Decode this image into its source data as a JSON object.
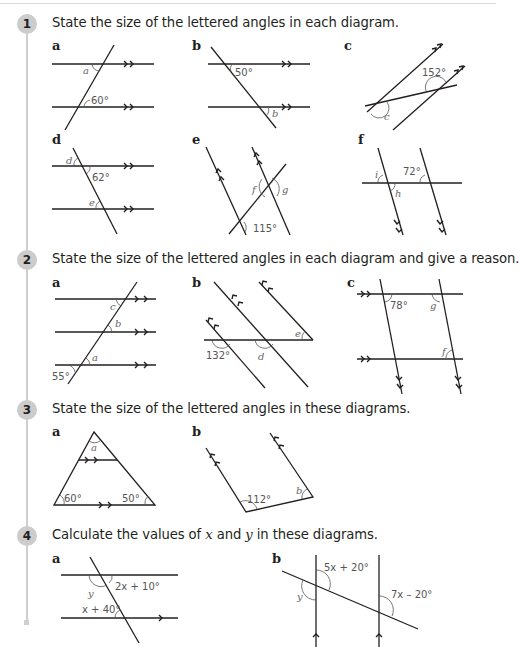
{
  "questions": [
    {
      "number": "1",
      "text": "State the size of the lettered angles in each diagram.",
      "parts": [
        {
          "label": "a",
          "given": [
            "60°"
          ],
          "unknowns": [
            "a"
          ]
        },
        {
          "label": "b",
          "given": [
            "50°"
          ],
          "unknowns": [
            "b"
          ]
        },
        {
          "label": "c",
          "given": [
            "152°"
          ],
          "unknowns": [
            "c"
          ]
        },
        {
          "label": "d",
          "given": [
            "62°"
          ],
          "unknowns": [
            "d",
            "e"
          ]
        },
        {
          "label": "e",
          "given": [
            "115°"
          ],
          "unknowns": [
            "f",
            "g"
          ]
        },
        {
          "label": "f",
          "given": [
            "72°"
          ],
          "unknowns": [
            "i",
            "h"
          ]
        }
      ]
    },
    {
      "number": "2",
      "text": "State the size of the lettered angles in each diagram and give a reason.",
      "parts": [
        {
          "label": "a",
          "given": [
            "55°"
          ],
          "unknowns": [
            "a",
            "b",
            "c"
          ]
        },
        {
          "label": "b",
          "given": [
            "132°"
          ],
          "unknowns": [
            "d",
            "e"
          ]
        },
        {
          "label": "c",
          "given": [
            "78°"
          ],
          "unknowns": [
            "g",
            "f"
          ]
        }
      ]
    },
    {
      "number": "3",
      "text": "State the size of the lettered angles in these diagrams.",
      "parts": [
        {
          "label": "a",
          "given": [
            "60°",
            "50°"
          ],
          "unknowns": [
            "a"
          ]
        },
        {
          "label": "b",
          "given": [
            "112°"
          ],
          "unknowns": [
            "b"
          ]
        }
      ]
    },
    {
      "number": "4",
      "text_pre": "Calculate the values of ",
      "var_x": "x",
      "text_mid": " and ",
      "var_y": "y",
      "text_post": " in these diagrams.",
      "parts": [
        {
          "label": "a",
          "given": [
            "2x + 10°",
            "x + 40°"
          ],
          "unknowns": [
            "y"
          ]
        },
        {
          "label": "b",
          "given": [
            "5x + 20°",
            "7x – 20°"
          ],
          "unknowns": [
            "y"
          ]
        }
      ]
    }
  ]
}
